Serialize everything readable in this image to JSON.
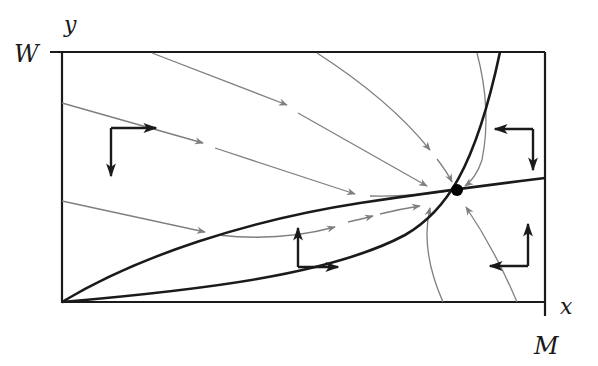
{
  "figure": {
    "type": "phase-plane",
    "axes": {
      "y_axis_label": "y",
      "y_max_label": "W",
      "x_axis_label": "x",
      "x_max_label": "M"
    },
    "colors": {
      "axes": "#1a1a1a",
      "nullclines": "#1a1a1a",
      "trajectories": "#7f7f7f",
      "direction_arrows": "#1a1a1a",
      "equilibrium": "#000000",
      "background": "#ffffff"
    },
    "equilibrium_point": {
      "label": "",
      "px": [
        457,
        190
      ]
    },
    "nullclines": [
      {
        "name": "steep-nullcline",
        "shape": "concave-up, from origin to top edge"
      },
      {
        "name": "shallow-nullcline",
        "shape": "concave-down, from origin to right edge"
      }
    ],
    "direction_indicators": [
      {
        "region": "upper-left",
        "horizontal": "right",
        "vertical": "down"
      },
      {
        "region": "upper-right",
        "horizontal": "left",
        "vertical": "down"
      },
      {
        "region": "lower-middle",
        "horizontal": "right",
        "vertical": "up"
      },
      {
        "region": "lower-right",
        "horizontal": "left",
        "vertical": "up"
      }
    ],
    "trajectories_count": 8
  }
}
